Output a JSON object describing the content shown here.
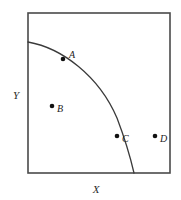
{
  "figure": {
    "name": "production-possibility-frontier-diagram",
    "background_color": "#ffffff",
    "frame": {
      "x": 28,
      "y": 13,
      "width": 142,
      "height": 160,
      "stroke_color": "#4a4a4a",
      "stroke_width": 1.6,
      "fill_color": "#ffffff"
    },
    "axes": {
      "x_label": "X",
      "y_label": "Y",
      "x_label_position": {
        "x": 96,
        "y": 190
      },
      "y_label_position": {
        "x": 16,
        "y": 96
      },
      "label_color": "#2b2b2b"
    },
    "curve": {
      "name": "frontier-curve",
      "stroke_color": "#3a3a3a",
      "stroke_width": 1.3,
      "start": {
        "x": 28,
        "y": 42
      },
      "end": {
        "x": 134,
        "y": 173
      },
      "path": "M 28 42 C 62 48, 99 76, 117 118 C 125 139, 131 160, 134 173",
      "shape": "concave-to-origin"
    },
    "points": [
      {
        "id": "A",
        "label": "A",
        "marker": {
          "x": 63,
          "y": 59
        },
        "label_position": {
          "x": 69,
          "y": 56
        },
        "relation": "on-curve",
        "color": "#111111"
      },
      {
        "id": "B",
        "label": "B",
        "marker": {
          "x": 52,
          "y": 106
        },
        "label_position": {
          "x": 57,
          "y": 110
        },
        "relation": "inside-curve",
        "color": "#111111"
      },
      {
        "id": "C",
        "label": "C",
        "marker": {
          "x": 117,
          "y": 136
        },
        "label_position": {
          "x": 122,
          "y": 140
        },
        "relation": "on-curve",
        "color": "#111111"
      },
      {
        "id": "D",
        "label": "D",
        "marker": {
          "x": 155,
          "y": 136
        },
        "label_position": {
          "x": 160,
          "y": 140
        },
        "relation": "outside-curve",
        "color": "#111111"
      }
    ],
    "marker_radius": 2.3
  },
  "chart_data": {
    "type": "line",
    "title": "",
    "subtitle": "",
    "xlabel": "X",
    "ylabel": "Y",
    "xlim": [
      0,
      1
    ],
    "ylim": [
      0,
      1
    ],
    "grid": false,
    "legend": null,
    "series": [
      {
        "name": "frontier",
        "description": "concave production possibility frontier from Y-intercept to X-axis",
        "x": [
          0.0,
          0.12,
          0.25,
          0.38,
          0.5,
          0.62,
          0.7,
          0.745
        ],
        "y": [
          0.82,
          0.795,
          0.75,
          0.685,
          0.6,
          0.46,
          0.32,
          0.0
        ]
      }
    ],
    "annotations": [
      {
        "label": "A",
        "x": 0.246,
        "y": 0.713,
        "note": "on the frontier"
      },
      {
        "label": "B",
        "x": 0.169,
        "y": 0.419,
        "note": "inside the frontier"
      },
      {
        "label": "C",
        "x": 0.627,
        "y": 0.231,
        "note": "on the frontier"
      },
      {
        "label": "D",
        "x": 0.894,
        "y": 0.231,
        "note": "outside the frontier"
      }
    ]
  }
}
